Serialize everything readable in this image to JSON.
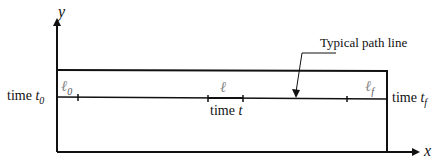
{
  "diagram": {
    "axes": {
      "x_label": "x",
      "y_label": "y"
    },
    "annotation": "Typical path line",
    "path_points": [
      {
        "symbol": "ℓ",
        "subscript": "0",
        "time_prefix": "time",
        "time_symbol": "t",
        "time_subscript": "0"
      },
      {
        "symbol": "ℓ",
        "subscript": "",
        "time_prefix": "time",
        "time_symbol": "t",
        "time_subscript": ""
      },
      {
        "symbol": "ℓ",
        "subscript": "f",
        "time_prefix": "time",
        "time_symbol": "t",
        "time_subscript": "f"
      }
    ],
    "colors": {
      "line": "#111111",
      "ell": "#888888"
    }
  }
}
